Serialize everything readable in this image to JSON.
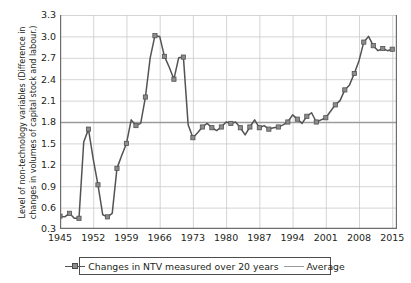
{
  "chart_data": {
    "type": "line",
    "title": "",
    "xlabel": "",
    "ylabel": "Level of non-technology variables (Difference in\nchanges in volumes of capital stock and labour.)",
    "xlim": [
      1945,
      2016
    ],
    "ylim": [
      0.3,
      3.3
    ],
    "ytick_labels": [
      "0.3",
      "0.6",
      "0.9",
      "1.2",
      "1.5",
      "1.8",
      "2.1",
      "2.4",
      "2.7",
      "3.0",
      "3.3"
    ],
    "ytick_values": [
      0.3,
      0.6,
      0.9,
      1.2,
      1.5,
      1.8,
      2.1,
      2.4,
      2.7,
      3.0,
      3.3
    ],
    "xtick_labels": [
      "1945",
      "1952",
      "1959",
      "1966",
      "1973",
      "1980",
      "1987",
      "1994",
      "2001",
      "2008",
      "2015"
    ],
    "xtick_values": [
      1945,
      1952,
      1959,
      1966,
      1973,
      1980,
      1987,
      1994,
      2001,
      2008,
      2015
    ],
    "grid": true,
    "legend_position": "bottom",
    "series": [
      {
        "name": "Changes in NTV measured over 20 years",
        "type": "line-markers",
        "color": "#555252",
        "marker_fill": "#8c8c8c",
        "x": [
          1945,
          1946,
          1947,
          1948,
          1949,
          1950,
          1951,
          1952,
          1953,
          1954,
          1955,
          1956,
          1957,
          1958,
          1959,
          1960,
          1961,
          1962,
          1963,
          1964,
          1965,
          1966,
          1967,
          1968,
          1969,
          1970,
          1971,
          1972,
          1973,
          1974,
          1975,
          1976,
          1977,
          1978,
          1979,
          1980,
          1981,
          1982,
          1983,
          1984,
          1985,
          1986,
          1987,
          1988,
          1989,
          1990,
          1991,
          1992,
          1993,
          1994,
          1995,
          1996,
          1997,
          1998,
          1999,
          2000,
          2001,
          2002,
          2003,
          2004,
          2005,
          2006,
          2007,
          2008,
          2009,
          2010,
          2011,
          2012,
          2013,
          2014,
          2015
        ],
        "y": [
          0.48,
          0.47,
          0.52,
          0.45,
          0.45,
          1.52,
          1.7,
          1.28,
          0.92,
          0.5,
          0.47,
          0.52,
          1.15,
          1.33,
          1.5,
          1.83,
          1.75,
          1.78,
          2.15,
          2.7,
          3.01,
          3.0,
          2.72,
          2.57,
          2.4,
          2.7,
          2.71,
          1.76,
          1.58,
          1.65,
          1.73,
          1.78,
          1.72,
          1.68,
          1.73,
          1.8,
          1.78,
          1.8,
          1.72,
          1.62,
          1.73,
          1.83,
          1.72,
          1.75,
          1.7,
          1.72,
          1.73,
          1.76,
          1.8,
          1.9,
          1.84,
          1.78,
          1.88,
          1.93,
          1.8,
          1.83,
          1.86,
          1.95,
          2.04,
          2.1,
          2.25,
          2.32,
          2.48,
          2.66,
          2.92,
          3.0,
          2.87,
          2.8,
          2.83,
          2.8,
          2.82
        ]
      },
      {
        "name": "Average",
        "type": "hline",
        "color": "#9b9b9b",
        "value": 1.8
      }
    ]
  },
  "axis": {
    "y_title": "Level of non-technology variables (Difference in\nchanges in volumes of capital stock and labour.)"
  },
  "legend": {
    "series_label": "Changes in NTV measured over 20 years",
    "average_label": "Average"
  },
  "colors": {
    "series_line": "#555252",
    "series_marker": "#8c8c8c",
    "average_line": "#9b9b9b",
    "grid": "#c9c9c9",
    "axis": "#6e6e6e",
    "text": "#231f20"
  }
}
